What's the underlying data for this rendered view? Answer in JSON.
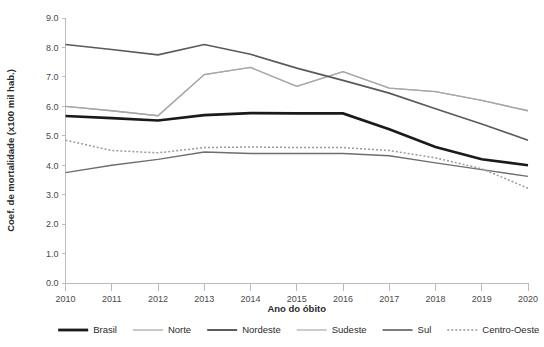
{
  "chart_data": {
    "type": "line",
    "title": "",
    "xlabel": "Ano do óbito",
    "ylabel": "Coef. de mortalidade (x100 mil hab.)",
    "x": [
      2010,
      2011,
      2012,
      2013,
      2014,
      2015,
      2016,
      2017,
      2018,
      2019,
      2020
    ],
    "categories": [
      "2010",
      "2011",
      "2012",
      "2013",
      "2014",
      "2015",
      "2016",
      "2017",
      "2018",
      "2019",
      "2020"
    ],
    "xlim": [
      2010,
      2020
    ],
    "ylim": [
      0.0,
      9.0
    ],
    "yticks": [
      "0.0",
      "1.0",
      "2.0",
      "3.0",
      "4.0",
      "5.0",
      "6.0",
      "7.0",
      "8.0",
      "9.0"
    ],
    "ytick_values": [
      0.0,
      1.0,
      2.0,
      3.0,
      4.0,
      5.0,
      6.0,
      7.0,
      8.0,
      9.0
    ],
    "grid": false,
    "legend_position": "bottom",
    "series": [
      {
        "name": "Brasil",
        "color": "#1a1a1a",
        "width": 2.6,
        "dash": "none",
        "values": [
          5.67,
          5.6,
          5.52,
          5.7,
          5.77,
          5.76,
          5.76,
          5.22,
          4.62,
          4.2,
          4.0
        ]
      },
      {
        "name": "Norte",
        "color": "#b0b0b0",
        "width": 1.3,
        "dash": "none",
        "values": [
          6.0,
          5.85,
          5.68,
          7.08,
          7.32,
          6.68,
          7.18,
          6.62,
          6.5,
          6.2,
          5.85
        ]
      },
      {
        "name": "Nordeste",
        "color": "#6e6e6e",
        "width": 1.4,
        "dash": "none",
        "values": [
          3.75,
          4.0,
          4.2,
          4.45,
          4.4,
          4.4,
          4.4,
          4.32,
          4.08,
          3.85,
          3.62
        ]
      },
      {
        "name": "Sudeste",
        "color": "#a8a8a8",
        "width": 1.3,
        "dash": "none",
        "values": [
          6.0,
          5.85,
          5.68,
          7.08,
          7.32,
          6.68,
          7.18,
          6.62,
          6.5,
          6.2,
          5.85
        ]
      },
      {
        "name": "Sul",
        "color": "#5a5a5a",
        "width": 1.7,
        "dash": "none",
        "values": [
          8.1,
          7.93,
          7.75,
          8.1,
          7.77,
          7.3,
          6.88,
          6.45,
          5.92,
          5.4,
          4.85
        ]
      },
      {
        "name": "Centro-Oeste",
        "color": "#9a9a9a",
        "width": 1.5,
        "dash": "2,2",
        "values": [
          4.85,
          4.5,
          4.42,
          4.6,
          4.62,
          4.6,
          4.6,
          4.5,
          4.25,
          3.88,
          3.22
        ]
      }
    ],
    "legend": [
      {
        "label": "Brasil",
        "color": "#1a1a1a",
        "width": 2.8,
        "dash": "none"
      },
      {
        "label": "Norte",
        "color": "#b0b0b0",
        "width": 1.4,
        "dash": "none"
      },
      {
        "label": "Nordeste",
        "color": "#4a4a4a",
        "width": 1.8,
        "dash": "none"
      },
      {
        "label": "Sudeste",
        "color": "#b0b0b0",
        "width": 1.3,
        "dash": "none"
      },
      {
        "label": "Sul",
        "color": "#6e6e6e",
        "width": 1.8,
        "dash": "none"
      },
      {
        "label": "Centro-Oeste",
        "color": "#9a9a9a",
        "width": 1.5,
        "dash": "2,2"
      }
    ]
  }
}
